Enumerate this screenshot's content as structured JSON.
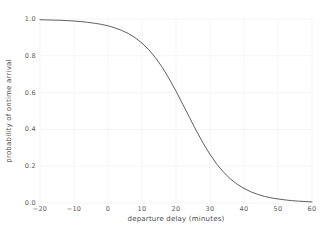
{
  "chart_data": {
    "type": "line",
    "title": "",
    "subtitle": "",
    "xlabel": "departure delay (minutes)",
    "ylabel": "probability of ontime arrival",
    "xlim": [
      -20,
      60
    ],
    "ylim": [
      0.0,
      1.0
    ],
    "xticks": [
      -20,
      -10,
      0,
      10,
      20,
      30,
      40,
      50,
      60
    ],
    "xtick_labels": [
      "−20",
      "−10",
      "0",
      "10",
      "20",
      "30",
      "40",
      "50",
      "60"
    ],
    "yticks": [
      0.0,
      0.2,
      0.4,
      0.6,
      0.8,
      1.0
    ],
    "ytick_labels": [
      "0.0",
      "0.2",
      "0.4",
      "0.6",
      "0.8",
      "1.0"
    ],
    "grid": true,
    "grid_color": "#f2f2f2",
    "legend": null,
    "legend_position": "none",
    "background_color": "#ffffff",
    "series": [
      {
        "name": "probability of ontime arrival",
        "color": "#4d4d4d",
        "line_width": 0.9,
        "x": [
          -20,
          -18,
          -16,
          -14,
          -12,
          -10,
          -8,
          -6,
          -4,
          -2,
          0,
          2,
          4,
          6,
          8,
          10,
          12,
          14,
          16,
          18,
          20,
          22,
          24,
          26,
          28,
          30,
          32,
          34,
          36,
          38,
          40,
          42,
          44,
          46,
          48,
          50,
          52,
          54,
          56,
          58,
          60
        ],
        "y": [
          0.996,
          0.995,
          0.994,
          0.993,
          0.991,
          0.989,
          0.986,
          0.982,
          0.977,
          0.971,
          0.963,
          0.952,
          0.938,
          0.921,
          0.898,
          0.869,
          0.833,
          0.789,
          0.736,
          0.675,
          0.608,
          0.536,
          0.464,
          0.392,
          0.325,
          0.264,
          0.211,
          0.167,
          0.131,
          0.102,
          0.079,
          0.061,
          0.047,
          0.036,
          0.028,
          0.022,
          0.017,
          0.013,
          0.01,
          0.008,
          0.006
        ]
      }
    ]
  }
}
